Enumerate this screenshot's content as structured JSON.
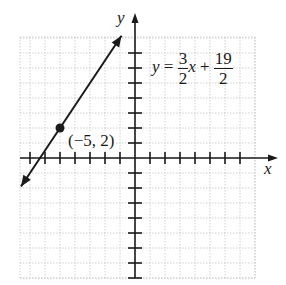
{
  "chart_data": {
    "type": "line",
    "title": "",
    "xlabel": "x",
    "ylabel": "y",
    "xlim": [
      -8,
      8
    ],
    "ylim": [
      -8,
      8
    ],
    "grid": true,
    "equation": {
      "lhs": "y",
      "eq": "=",
      "slope_num": "3",
      "slope_den": "2",
      "var": "x",
      "plus": "+",
      "int_num": "19",
      "int_den": "2"
    },
    "series": [
      {
        "name": "y = 3/2 x + 19/2",
        "slope": 1.5,
        "intercept": 9.5,
        "x": [
          -7.6,
          -0.9
        ],
        "y": [
          -1.9,
          8.15
        ]
      }
    ],
    "points": [
      {
        "x": -5,
        "y": 2,
        "label": "(−5, 2)"
      }
    ],
    "colors": {
      "line": "#1a1a1a",
      "grid": "#bfbfbf",
      "axis": "#1a1a1a"
    }
  }
}
